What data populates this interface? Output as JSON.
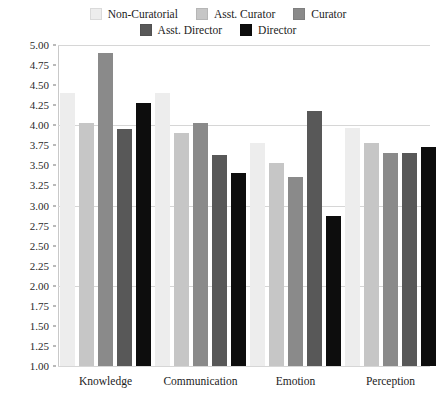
{
  "chart_data": {
    "type": "bar",
    "title": "",
    "xlabel": "",
    "ylabel": "",
    "ylim": [
      1.0,
      5.0
    ],
    "ytick_step": 0.25,
    "grid": true,
    "grid_major_values": [
      5.0,
      4.0,
      3.0,
      2.0,
      1.0
    ],
    "legend_position": "top-center",
    "categories": [
      "Knowledge",
      "Communication",
      "Emotion",
      "Perception"
    ],
    "ytick_labels": [
      "5.00",
      "4.75",
      "4.50",
      "4.25",
      "4.00",
      "3.75",
      "3.50",
      "3.25",
      "3.00",
      "2.75",
      "2.50",
      "2.25",
      "2.00",
      "1.75",
      "1.50",
      "1.25",
      "1.00"
    ],
    "series": [
      {
        "name": "Non-Curatorial",
        "color": "#ededed",
        "values": [
          4.38,
          4.38,
          3.75,
          3.94
        ]
      },
      {
        "name": "Asst. Curator",
        "color": "#c6c6c6",
        "values": [
          4.0,
          3.88,
          3.5,
          3.75
        ]
      },
      {
        "name": "Curator",
        "color": "#8a8a8a",
        "values": [
          4.88,
          4.0,
          3.33,
          3.63
        ]
      },
      {
        "name": "Asst. Director",
        "color": "#585858",
        "values": [
          3.93,
          3.6,
          4.15,
          3.63
        ]
      },
      {
        "name": "Director",
        "color": "#0d0d0d",
        "values": [
          4.25,
          3.38,
          2.85,
          3.7
        ]
      }
    ]
  }
}
